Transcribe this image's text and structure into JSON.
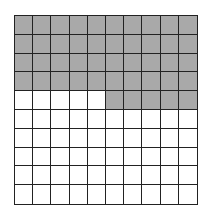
{
  "diagram": {
    "type": "hundred-grid",
    "rows": 10,
    "columns": 10,
    "total_cells": 100,
    "shaded_cells": 45,
    "shaded_pattern": "rows 1-4 fully shaded; row 5 columns 6-10 shaded",
    "colors": {
      "shaded": "#a9a9a9",
      "unshaded": "#ffffff",
      "gridline": "#222222"
    }
  }
}
